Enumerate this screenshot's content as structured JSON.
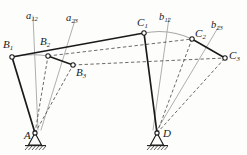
{
  "figure": {
    "type": "kinematic-diagram",
    "background_color": "#fdfdfc",
    "line_color": "#1a1a1a",
    "construction_color": "#8f8f8f",
    "dash_color": "#3a3a3a"
  },
  "labels": {
    "b1": {
      "base": "B",
      "sub": "1"
    },
    "b2": {
      "base": "B",
      "sub": "2"
    },
    "b3": {
      "base": "B",
      "sub": "3"
    },
    "c1": {
      "base": "C",
      "sub": "1"
    },
    "c2": {
      "base": "C",
      "sub": "2"
    },
    "c3": {
      "base": "C",
      "sub": "3"
    },
    "a": {
      "base": "A",
      "sub": ""
    },
    "d": {
      "base": "D",
      "sub": ""
    },
    "a12": {
      "base": "a",
      "sub": "12"
    },
    "a23": {
      "base": "a",
      "sub": "23"
    },
    "b12": {
      "base": "b",
      "sub": "12"
    },
    "b23": {
      "base": "b",
      "sub": "23"
    }
  },
  "points": {
    "A": {
      "x": 35,
      "y": 133
    },
    "D": {
      "x": 157,
      "y": 133
    },
    "B1": {
      "x": 12,
      "y": 57
    },
    "B2": {
      "x": 48,
      "y": 56
    },
    "B3": {
      "x": 73,
      "y": 65
    },
    "C1": {
      "x": 144,
      "y": 33
    },
    "C2": {
      "x": 192,
      "y": 39
    },
    "C3": {
      "x": 225,
      "y": 58
    }
  },
  "label_positions": {
    "B1": {
      "x": 3,
      "y": 39
    },
    "B2": {
      "x": 40,
      "y": 37
    },
    "B3": {
      "x": 75,
      "y": 67
    },
    "C1": {
      "x": 137,
      "y": 17
    },
    "C2": {
      "x": 194,
      "y": 28
    },
    "C3": {
      "x": 228,
      "y": 50
    },
    "A": {
      "x": 25,
      "y": 131
    },
    "D": {
      "x": 162,
      "y": 128
    },
    "a12": {
      "x": 26,
      "y": 11
    },
    "a23": {
      "x": 66,
      "y": 13
    },
    "b12": {
      "x": 159,
      "y": 12
    },
    "b23": {
      "x": 211,
      "y": 20
    }
  },
  "links": {
    "crank_solid": [
      [
        "A",
        "B1"
      ],
      [
        "D",
        "C1"
      ]
    ],
    "crank_dashed": [
      [
        "A",
        "B2"
      ],
      [
        "A",
        "B3"
      ],
      [
        "D",
        "C2"
      ],
      [
        "D",
        "C3"
      ]
    ],
    "coupler_solid": [
      [
        "B1",
        "C1"
      ]
    ],
    "coupler_dashed": [
      [
        "B2",
        "C2"
      ],
      [
        "B3",
        "C3"
      ]
    ],
    "arc_links": [
      [
        "B1",
        "B2"
      ],
      [
        "B2",
        "B3"
      ],
      [
        "C1",
        "C2"
      ],
      [
        "C2",
        "C3"
      ]
    ]
  },
  "construction_lines": {
    "a12": {
      "x1": 38,
      "y1": 130,
      "x2": 33,
      "y2": 16
    },
    "a23": {
      "x1": 41,
      "y1": 130,
      "x2": 75,
      "y2": 20
    },
    "b12": {
      "x1": 153,
      "y1": 130,
      "x2": 169,
      "y2": 18
    },
    "b23": {
      "x1": 157,
      "y1": 130,
      "x2": 219,
      "y2": 26
    }
  },
  "ground_supports": [
    {
      "name": "A",
      "x": 35,
      "y": 133
    },
    {
      "name": "D",
      "x": 157,
      "y": 133
    }
  ]
}
